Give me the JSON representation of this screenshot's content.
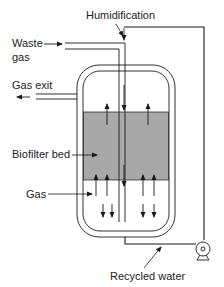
{
  "diagram": {
    "labels": {
      "humidification": "Humidification",
      "waste_gas_line1": "Waste",
      "waste_gas_line2": "gas",
      "gas_exit": "Gas exit",
      "biofilter_bed": "Biofilter bed",
      "gas": "Gas",
      "recycled_water": "Recycled water"
    },
    "colors": {
      "line": "#1a1a1a",
      "bed_fill": "#a8a8a8",
      "background": "#ffffff"
    },
    "components": [
      "vessel",
      "biofilter-bed",
      "waste-gas-inlet-pipe",
      "gas-exit-pipe",
      "humidification-line",
      "pump",
      "recycled-water-pipe"
    ]
  }
}
